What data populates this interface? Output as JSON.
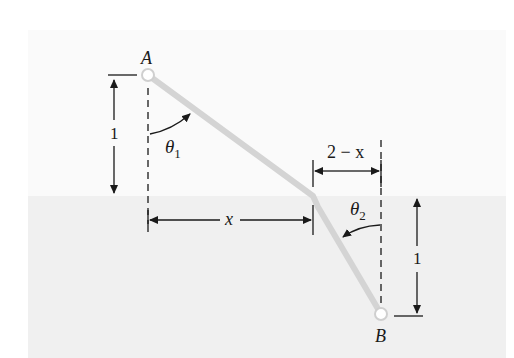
{
  "diagram": {
    "colors": {
      "upper_medium": "#fafafa",
      "lower_medium": "#f0f0f0",
      "path": "#d4d4d4",
      "lines": "#1a1a1a"
    },
    "points": {
      "A": {
        "label": "A"
      },
      "B": {
        "label": "B"
      }
    },
    "dimensions": {
      "left_height": "1",
      "right_height": "1",
      "horizontal_x": "x",
      "horizontal_2_minus_x": "2 − x"
    },
    "angles": {
      "theta1": {
        "symbol": "θ",
        "subscript": "1"
      },
      "theta2": {
        "symbol": "θ",
        "subscript": "2"
      }
    }
  }
}
